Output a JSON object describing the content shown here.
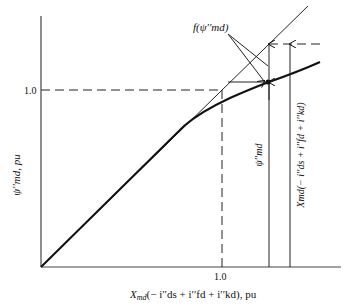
{
  "diagram": {
    "x_axis": {
      "label_main": "X",
      "label_sub": "md",
      "label_rest": "(− i′′ds + i′′fd + i′′kd), pu",
      "tick": "1.0"
    },
    "y_axis": {
      "label": "ψ′′md, pu",
      "tick": "1.0"
    },
    "annotations": {
      "f_label": "f(ψ′′md)",
      "psi_label": "ψ′′md",
      "x_product_label": "Xmd(− i′′ds + i′′fd + i′′kd)"
    },
    "curves": [
      {
        "name": "air-gap line",
        "type": "straight"
      },
      {
        "name": "saturation curve",
        "type": "curved"
      }
    ]
  }
}
